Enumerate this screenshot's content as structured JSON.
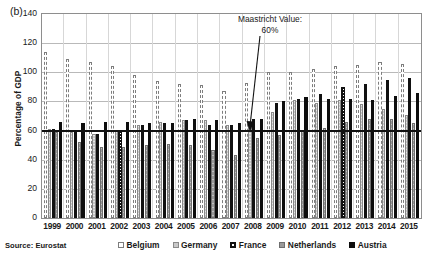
{
  "panel_label": "(b)",
  "source_note": "Source: Eurostat",
  "annotation": {
    "line1": "Maastricht Value:",
    "line2": "60%",
    "value": 60
  },
  "axes": {
    "ylabel": "Percentage of GDP",
    "yticks": [
      140,
      120,
      100,
      80,
      60,
      40,
      20,
      0
    ],
    "ylim": [
      0,
      140
    ]
  },
  "colors": {
    "belgium": "#ffffff",
    "germany": "#c9c9c9",
    "france": "#111111",
    "netherlands": "#9a9a9a",
    "austria": "#0d0d0d",
    "maastricht_line": "#111111",
    "gridline": "#b9b9b9",
    "frame": "#8e8e8e"
  },
  "chart_data": {
    "type": "bar",
    "title": "",
    "subtitle": "",
    "xlabel": "",
    "ylabel": "Percentage of GDP",
    "ylim": [
      0,
      140
    ],
    "ytick_step": 20,
    "grid": true,
    "legend_position": "bottom",
    "annotations": [
      {
        "text": "Maastricht Value: 60%",
        "type": "hline-label",
        "y": 60
      }
    ],
    "categories": [
      "1999",
      "2000",
      "2001",
      "2002",
      "2003",
      "2004",
      "2005",
      "2006",
      "2007",
      "2008",
      "2009",
      "2010",
      "2011",
      "2012",
      "2013",
      "2014",
      "2015"
    ],
    "series": [
      {
        "name": "Belgium",
        "values": [
          114,
          109,
          107,
          104,
          98,
          94,
          92,
          91,
          87,
          93,
          100,
          100,
          102,
          104,
          105,
          107,
          106
        ]
      },
      {
        "name": "Germany",
        "values": [
          61,
          59,
          58,
          60,
          64,
          66,
          67,
          67,
          64,
          65,
          73,
          81,
          79,
          81,
          78,
          75,
          71
        ]
      },
      {
        "name": "France",
        "values": [
          61,
          59,
          58,
          60,
          64,
          65,
          67,
          64,
          64,
          68,
          79,
          82,
          85,
          90,
          92,
          95,
          96
        ]
      },
      {
        "name": "Netherlands",
        "values": [
          59,
          52,
          49,
          49,
          50,
          51,
          50,
          47,
          43,
          55,
          57,
          60,
          62,
          66,
          68,
          68,
          65
        ]
      },
      {
        "name": "Austria",
        "values": [
          66,
          65,
          66,
          66,
          65,
          65,
          68,
          67,
          65,
          68,
          80,
          83,
          82,
          82,
          81,
          84,
          86
        ]
      }
    ]
  },
  "legend": [
    {
      "label": "Belgium",
      "swatch": "belgium-swatch-icon"
    },
    {
      "label": "Germany",
      "swatch": "germany-swatch-icon"
    },
    {
      "label": "France",
      "swatch": "france-swatch-icon"
    },
    {
      "label": "Netherlands",
      "swatch": "netherlands-swatch-icon"
    },
    {
      "label": "Austria",
      "swatch": "austria-swatch-icon"
    }
  ]
}
